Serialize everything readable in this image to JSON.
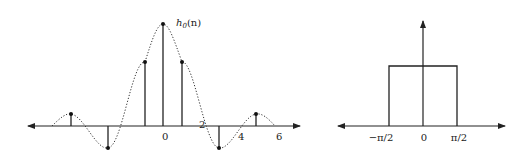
{
  "left_plot": {
    "title": "h",
    "title_sub": "0",
    "title_arg": "(n)",
    "x_tick_labels": [
      "0",
      "2",
      "4",
      "6"
    ],
    "samples": [
      {
        "n": -5,
        "value": 0.12
      },
      {
        "n": -3,
        "value": -0.21
      },
      {
        "n": -1,
        "value": 0.64
      },
      {
        "n": 0,
        "value": 1.0
      },
      {
        "n": 1,
        "value": 0.64
      },
      {
        "n": 3,
        "value": -0.21
      },
      {
        "n": 5,
        "value": 0.12
      }
    ],
    "envelope": "sinc (dotted)"
  },
  "right_plot": {
    "x_tick_labels": [
      "−π/2",
      "0",
      "π/2"
    ],
    "passband": {
      "low": "-π/2",
      "high": "π/2",
      "height": 1
    }
  },
  "colors": {
    "ink": "#222222",
    "background": "#ffffff"
  }
}
